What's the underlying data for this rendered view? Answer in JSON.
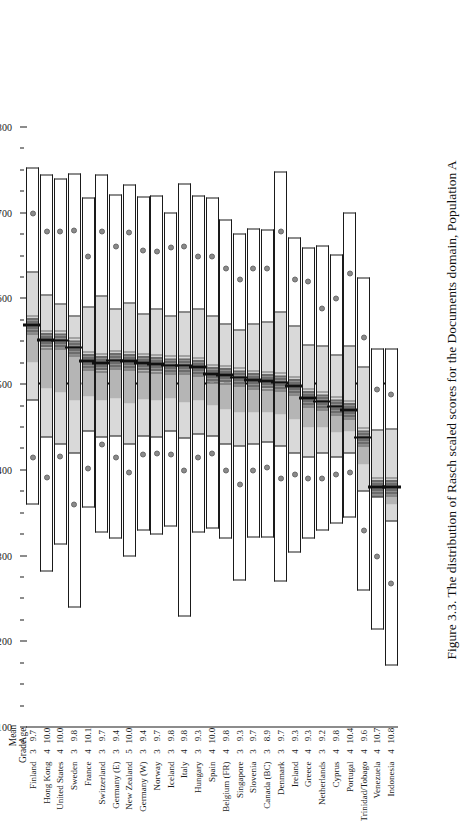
{
  "figure": {
    "caption": "Figure 3.3. The distribution of Rasch scaled scores for the Documents domain, Population A",
    "header_mean": "Mean",
    "header_age": "Age",
    "header_grade": "Grade"
  },
  "chart_data": {
    "type": "box",
    "title": "The distribution of Rasch scaled scores for the Documents domain, Population A",
    "xlabel": "",
    "ylabel": "Rasch scaled score",
    "ylim": [
      100,
      800
    ],
    "yticks": [
      100,
      200,
      300,
      400,
      500,
      600,
      700,
      800
    ],
    "minor_tick_step": 25,
    "grid": false,
    "reference_line": 500,
    "reference_line_style": "dashed",
    "percentiles": [
      5,
      25,
      75,
      95
    ],
    "band_legend": [
      "5th-25th percentile",
      "25th-75th percentile",
      "75th-95th percentile"
    ],
    "categories": [
      "Finland",
      "Hong Kong",
      "United States",
      "Sweden",
      "France",
      "Switzerland",
      "Germany (E)",
      "New Zealand",
      "Germany (W)",
      "Norway",
      "Iceland",
      "Italy",
      "Hungary",
      "Spain",
      "Belgium (FR)",
      "Singapore",
      "Slovenia",
      "Canada (BC)",
      "Denmark",
      "Ireland",
      "Greece",
      "Netherlands",
      "Cyprus",
      "Portugal",
      "Trinidad/Tobago",
      "Venezuela",
      "Indonesia"
    ],
    "grade": [
      3,
      4,
      4,
      3,
      4,
      3,
      3,
      5,
      3,
      3,
      3,
      4,
      3,
      4,
      4,
      3,
      3,
      3,
      3,
      4,
      4,
      3,
      4,
      4,
      4,
      4,
      4
    ],
    "mean_age": [
      9.7,
      10.0,
      10.0,
      9.8,
      10.1,
      9.7,
      9.4,
      10.0,
      9.4,
      9.7,
      9.8,
      9.8,
      9.3,
      10.0,
      9.8,
      9.3,
      9.7,
      8.9,
      9.7,
      9.3,
      9.3,
      9.2,
      9.8,
      10.4,
      9.6,
      10.7,
      10.8
    ],
    "series": [
      {
        "country": "Finland",
        "p5": 360,
        "p25": 482,
        "mean": 569,
        "p75": 631,
        "p95": 753,
        "dot_low": 415,
        "dot_high": 700
      },
      {
        "country": "Hong Kong",
        "p5": 282,
        "p25": 438,
        "mean": 552,
        "p75": 604,
        "p95": 745,
        "dot_low": 392,
        "dot_high": 679
      },
      {
        "country": "United States",
        "p5": 314,
        "p25": 430,
        "mean": 551,
        "p75": 593,
        "p95": 740,
        "dot_low": 416,
        "dot_high": 679
      },
      {
        "country": "Sweden",
        "p5": 240,
        "p25": 420,
        "mean": 543,
        "p75": 580,
        "p95": 746,
        "dot_low": 360,
        "dot_high": 680
      },
      {
        "country": "France",
        "p5": 357,
        "p25": 445,
        "mean": 527,
        "p75": 590,
        "p95": 718,
        "dot_low": 402,
        "dot_high": 649
      },
      {
        "country": "Switzerland",
        "p5": 327,
        "p25": 438,
        "mean": 525,
        "p75": 603,
        "p95": 745,
        "dot_low": 430,
        "dot_high": 679
      },
      {
        "country": "Germany (E)",
        "p5": 320,
        "p25": 440,
        "mean": 528,
        "p75": 588,
        "p95": 722,
        "dot_low": 415,
        "dot_high": 661
      },
      {
        "country": "New Zealand",
        "p5": 300,
        "p25": 430,
        "mean": 527,
        "p75": 595,
        "p95": 734,
        "dot_low": 398,
        "dot_high": 677
      },
      {
        "country": "Germany (W)",
        "p5": 330,
        "p25": 440,
        "mean": 525,
        "p75": 582,
        "p95": 720,
        "dot_low": 418,
        "dot_high": 657
      },
      {
        "country": "Norway",
        "p5": 325,
        "p25": 438,
        "mean": 524,
        "p75": 588,
        "p95": 721,
        "dot_low": 420,
        "dot_high": 655
      },
      {
        "country": "Iceland",
        "p5": 334,
        "p25": 445,
        "mean": 522,
        "p75": 580,
        "p95": 701,
        "dot_low": 418,
        "dot_high": 660
      },
      {
        "country": "Italy",
        "p5": 230,
        "p25": 437,
        "mean": 522,
        "p75": 584,
        "p95": 735,
        "dot_low": 400,
        "dot_high": 661
      },
      {
        "country": "Hungary",
        "p5": 328,
        "p25": 442,
        "mean": 520,
        "p75": 588,
        "p95": 721,
        "dot_low": 415,
        "dot_high": 650
      },
      {
        "country": "Spain",
        "p5": 332,
        "p25": 440,
        "mean": 512,
        "p75": 580,
        "p95": 718,
        "dot_low": 420,
        "dot_high": 649
      },
      {
        "country": "Belgium (FR)",
        "p5": 320,
        "p25": 430,
        "mean": 511,
        "p75": 570,
        "p95": 693,
        "dot_low": 400,
        "dot_high": 635
      },
      {
        "country": "Singapore",
        "p5": 272,
        "p25": 428,
        "mean": 508,
        "p75": 563,
        "p95": 676,
        "dot_low": 383,
        "dot_high": 623
      },
      {
        "country": "Slovenia",
        "p5": 322,
        "p25": 430,
        "mean": 505,
        "p75": 570,
        "p95": 682,
        "dot_low": 400,
        "dot_high": 636
      },
      {
        "country": "Canada (BC)",
        "p5": 322,
        "p25": 432,
        "mean": 504,
        "p75": 572,
        "p95": 681,
        "dot_low": 403,
        "dot_high": 636
      },
      {
        "country": "Denmark",
        "p5": 270,
        "p25": 428,
        "mean": 502,
        "p75": 584,
        "p95": 749,
        "dot_low": 390,
        "dot_high": 679
      },
      {
        "country": "Ireland",
        "p5": 304,
        "p25": 420,
        "mean": 498,
        "p75": 568,
        "p95": 672,
        "dot_low": 395,
        "dot_high": 623
      },
      {
        "country": "Greece",
        "p5": 320,
        "p25": 415,
        "mean": 484,
        "p75": 546,
        "p95": 660,
        "dot_low": 390,
        "dot_high": 620
      },
      {
        "country": "Netherlands",
        "p5": 330,
        "p25": 420,
        "mean": 480,
        "p75": 545,
        "p95": 662,
        "dot_low": 390,
        "dot_high": 589
      },
      {
        "country": "Cyprus",
        "p5": 338,
        "p25": 415,
        "mean": 474,
        "p75": 534,
        "p95": 652,
        "dot_low": 395,
        "dot_high": 601
      },
      {
        "country": "Portugal",
        "p5": 345,
        "p25": 420,
        "mean": 470,
        "p75": 545,
        "p95": 701,
        "dot_low": 398,
        "dot_high": 630
      },
      {
        "country": "Trinidad/Tobago",
        "p5": 260,
        "p25": 375,
        "mean": 438,
        "p75": 520,
        "p95": 625,
        "dot_low": 330,
        "dot_high": 555
      },
      {
        "country": "Venezuela",
        "p5": 214,
        "p25": 368,
        "mean": 380,
        "p75": 446,
        "p95": 542,
        "dot_low": 300,
        "dot_high": 494
      },
      {
        "country": "Indonesia",
        "p5": 172,
        "p25": 340,
        "mean": 380,
        "p75": 448,
        "p95": 542,
        "dot_low": 268,
        "dot_high": 488
      }
    ]
  },
  "colors": {
    "band_outer": "#ffffff",
    "band_mid": "#d9d9d9",
    "band_inner": "#b5b5b5",
    "band_core": "#8f8f8f",
    "mean_line": "#111111",
    "reference_line": "#111111",
    "dot": "#8a8a8a",
    "outline": "#1a1a1a"
  }
}
